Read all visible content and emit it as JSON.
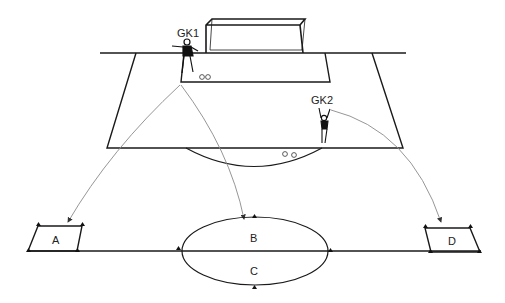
{
  "diagram": {
    "type": "soccer-goalkeeper-drill",
    "players": [
      {
        "id": "gk1",
        "label": "GK1"
      },
      {
        "id": "gk2",
        "label": "GK2"
      }
    ],
    "zones": [
      {
        "id": "a",
        "label": "A"
      },
      {
        "id": "b",
        "label": "B"
      },
      {
        "id": "c",
        "label": "C"
      },
      {
        "id": "d",
        "label": "D"
      }
    ],
    "balls": {
      "near_gk1": 2,
      "near_arc": 2
    },
    "colors": {
      "line": "#1a1a1a",
      "arrow": "#8a8a8a",
      "background": "#ffffff"
    }
  }
}
